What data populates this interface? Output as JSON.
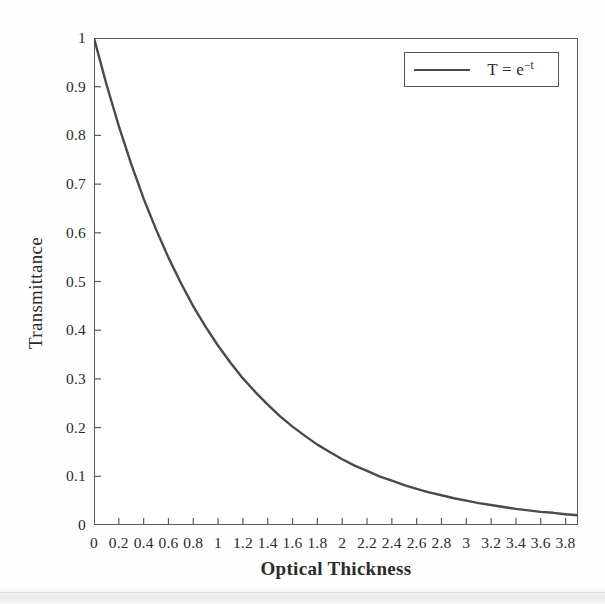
{
  "chart_data": {
    "type": "line",
    "title": "",
    "xlabel": "Optical Thickness",
    "ylabel": "Transmittance",
    "xlim": [
      0,
      3.9
    ],
    "ylim": [
      0,
      1
    ],
    "grid": false,
    "legend_position": "top-right",
    "legend": [
      {
        "label_base": "T = e",
        "label_exponent": "−t",
        "label_full": "T = e−t",
        "color": "#4a4a4a"
      }
    ],
    "xticks": [
      "0",
      "0.2",
      "0.4",
      "0.6",
      "0.8",
      "1",
      "1.2",
      "1.4",
      "1.6",
      "1.8",
      "2",
      "2.2",
      "2.4",
      "2.6",
      "2.8",
      "3",
      "3.2",
      "3.4",
      "3.6",
      "3.8"
    ],
    "xtick_values": [
      0,
      0.2,
      0.4,
      0.6,
      0.8,
      1,
      1.2,
      1.4,
      1.6,
      1.8,
      2,
      2.2,
      2.4,
      2.6,
      2.8,
      3,
      3.2,
      3.4,
      3.6,
      3.8
    ],
    "yticks": [
      "0",
      "0.1",
      "0.2",
      "0.3",
      "0.4",
      "0.5",
      "0.6",
      "0.7",
      "0.8",
      "0.9",
      "1"
    ],
    "ytick_values": [
      0,
      0.1,
      0.2,
      0.3,
      0.4,
      0.5,
      0.6,
      0.7,
      0.8,
      0.9,
      1
    ],
    "series": [
      {
        "name": "T = e−t",
        "color": "#4a4a4a",
        "line_width": 2.4,
        "x": [
          0,
          0.1,
          0.2,
          0.3,
          0.4,
          0.5,
          0.6,
          0.7,
          0.8,
          0.9,
          1,
          1.1,
          1.2,
          1.3,
          1.4,
          1.5,
          1.6,
          1.7,
          1.8,
          1.9,
          2,
          2.1,
          2.2,
          2.3,
          2.4,
          2.5,
          2.6,
          2.7,
          2.8,
          2.9,
          3,
          3.1,
          3.2,
          3.3,
          3.4,
          3.5,
          3.6,
          3.7,
          3.8,
          3.9
        ],
        "y": [
          1.0,
          0.905,
          0.819,
          0.741,
          0.67,
          0.607,
          0.549,
          0.497,
          0.449,
          0.407,
          0.368,
          0.333,
          0.301,
          0.273,
          0.247,
          0.223,
          0.202,
          0.183,
          0.165,
          0.15,
          0.135,
          0.122,
          0.111,
          0.1,
          0.091,
          0.082,
          0.074,
          0.067,
          0.061,
          0.055,
          0.05,
          0.045,
          0.041,
          0.037,
          0.033,
          0.03,
          0.027,
          0.025,
          0.022,
          0.02
        ]
      }
    ]
  },
  "axes": {
    "frame_color": "#5a5a5a",
    "tick_color": "#5a5a5a",
    "background": "#ffffff"
  }
}
